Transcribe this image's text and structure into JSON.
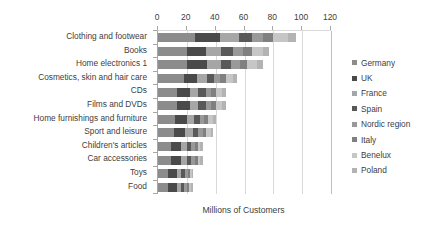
{
  "chart_data": {
    "type": "bar",
    "orientation": "horizontal",
    "stacked": true,
    "title": "",
    "xlabel": "Millions of Customers",
    "ylabel": "",
    "xlim": [
      0,
      120
    ],
    "xticks": [
      0,
      20,
      40,
      60,
      80,
      100,
      120
    ],
    "grid": true,
    "legend_position": "right",
    "categories": [
      "Clothing and footwear",
      "Books",
      "Home electronics 1",
      "Cosmetics, skin and hair care",
      "CDs",
      "Films and DVDs",
      "Home furnishings and furniture",
      "Sport and leisure",
      "Children's articles",
      "Car accessories",
      "Toys",
      "Food"
    ],
    "series": [
      {
        "name": "Germany",
        "color": "#8c8c8c",
        "values": [
          26.0,
          20.0,
          20.0,
          18.0,
          13.0,
          13.0,
          12.0,
          11.0,
          9.0,
          9.0,
          7.0,
          7.0
        ]
      },
      {
        "name": "UK",
        "color": "#4a4a4a",
        "values": [
          17.0,
          13.0,
          14.0,
          9.0,
          9.0,
          9.0,
          8.0,
          8.0,
          7.0,
          7.0,
          6.0,
          6.0
        ]
      },
      {
        "name": "France",
        "color": "#a6a6a6",
        "values": [
          13.0,
          11.0,
          10.0,
          7.0,
          6.0,
          6.0,
          5.0,
          5.0,
          4.0,
          4.0,
          3.0,
          3.0
        ]
      },
      {
        "name": "Spain",
        "color": "#595959",
        "values": [
          9.0,
          8.0,
          7.0,
          5.0,
          5.0,
          5.0,
          4.0,
          4.0,
          3.0,
          3.0,
          2.5,
          2.0
        ]
      },
      {
        "name": "Nordic region",
        "color": "#999999",
        "values": [
          8.0,
          7.0,
          6.0,
          4.0,
          4.0,
          4.0,
          3.0,
          3.0,
          2.5,
          2.5,
          2.0,
          2.0
        ]
      },
      {
        "name": "Italy",
        "color": "#808080",
        "values": [
          7.0,
          6.0,
          5.0,
          4.0,
          3.5,
          3.5,
          3.0,
          2.5,
          2.0,
          2.0,
          1.5,
          1.5
        ]
      },
      {
        "name": "Benelux",
        "color": "#c6c6c6",
        "values": [
          10.0,
          8.0,
          7.0,
          5.0,
          4.0,
          4.0,
          3.0,
          3.0,
          2.0,
          2.0,
          1.5,
          1.5
        ]
      },
      {
        "name": "Poland",
        "color": "#b3b3b3",
        "values": [
          6.0,
          4.0,
          4.0,
          3.0,
          2.5,
          2.5,
          2.0,
          2.0,
          1.5,
          1.5,
          1.0,
          1.0
        ]
      }
    ],
    "totals": [
      96.0,
      77.0,
      73.0,
      55.0,
      47.0,
      47.0,
      40.0,
      38.5,
      31.0,
      31.0,
      24.5,
      24.0
    ]
  }
}
